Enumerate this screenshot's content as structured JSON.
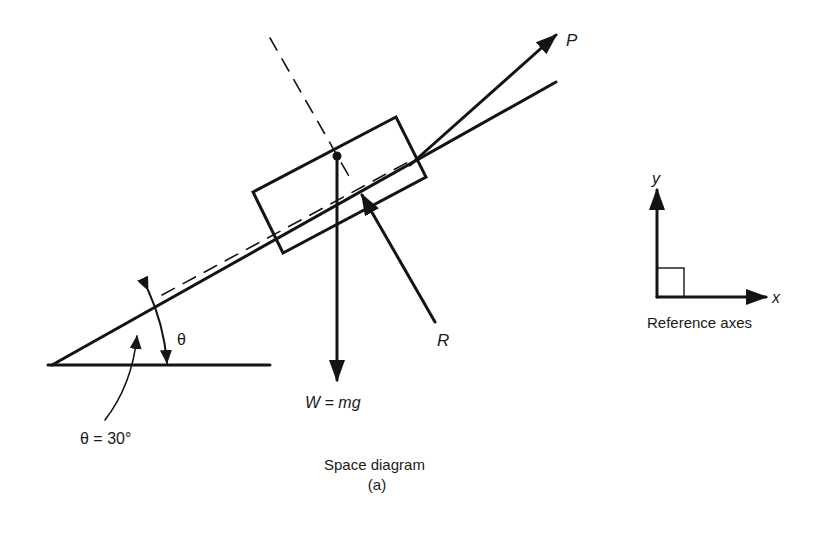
{
  "diagram": {
    "type": "free-body / space diagram",
    "caption": {
      "title": "Space diagram",
      "sub": "(a)"
    },
    "forces": {
      "applied": {
        "label": "P",
        "direction": "up the slope"
      },
      "weight": {
        "label": "W = mg",
        "direction": "vertically down"
      },
      "reaction": {
        "label": "R",
        "direction": "normal to slope"
      }
    },
    "angle": {
      "symbol": "θ",
      "value_label": "θ = 30°",
      "value_deg": 30
    },
    "reference_axes": {
      "title": "Reference axes",
      "x_label": "x",
      "y_label": "y"
    },
    "colors": {
      "ink": "#141414",
      "background": "#ffffff"
    }
  }
}
